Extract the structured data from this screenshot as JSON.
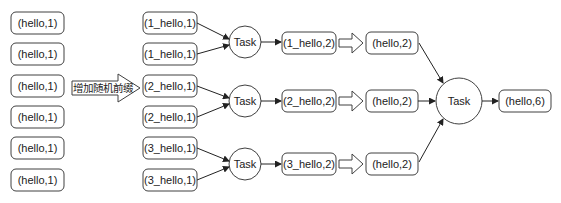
{
  "diagram": {
    "source_nodes": [
      {
        "label": "(hello,1)"
      },
      {
        "label": "(hello,1)"
      },
      {
        "label": "(hello,1)"
      },
      {
        "label": "(hello,1)"
      },
      {
        "label": "(hello,1)"
      },
      {
        "label": "(hello,1)"
      }
    ],
    "transform_arrow_label": "增加随机前缀",
    "prefixed_nodes": [
      {
        "label": "(1_hello,1)"
      },
      {
        "label": "(1_hello,1)"
      },
      {
        "label": "(2_hello,1)"
      },
      {
        "label": "(2_hello,1)"
      },
      {
        "label": "(3_hello,1)"
      },
      {
        "label": "(3_hello,1)"
      }
    ],
    "stage1_tasks": [
      {
        "label": "Task"
      },
      {
        "label": "Task"
      },
      {
        "label": "Task"
      }
    ],
    "partial_results": [
      {
        "label": "(1_hello,2)"
      },
      {
        "label": "(2_hello,2)"
      },
      {
        "label": "(3_hello,2)"
      }
    ],
    "prefix_removed": [
      {
        "label": "(hello,2)"
      },
      {
        "label": "(hello,2)"
      },
      {
        "label": "(hello,2)"
      }
    ],
    "final_task": {
      "label": "Task"
    },
    "final_result": {
      "label": "(hello,6)"
    }
  }
}
